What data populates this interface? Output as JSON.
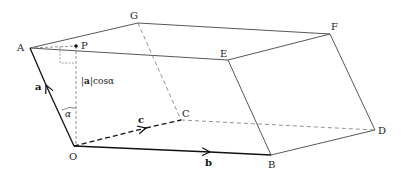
{
  "diagram": {
    "points": {
      "A": {
        "label": "A",
        "x": 30,
        "y": 48
      },
      "P": {
        "label": "P",
        "x": 76,
        "y": 46
      },
      "G": {
        "label": "G",
        "x": 138,
        "y": 23
      },
      "F": {
        "label": "F",
        "x": 330,
        "y": 34
      },
      "E": {
        "label": "E",
        "x": 228,
        "y": 60
      },
      "O": {
        "label": "O",
        "x": 74,
        "y": 146
      },
      "B": {
        "label": "B",
        "x": 271,
        "y": 155
      },
      "C": {
        "label": "C",
        "x": 181,
        "y": 120
      },
      "D": {
        "label": "D",
        "x": 375,
        "y": 130
      }
    },
    "vectors": {
      "a": "a",
      "b": "b",
      "c": "c"
    },
    "annotations": {
      "projection_bold": "a",
      "projection_left": "|",
      "projection_right": "|cosα",
      "angle": "α"
    },
    "colors": {
      "line": "#333333",
      "dashed": "#555555",
      "vector": "#111111"
    }
  }
}
